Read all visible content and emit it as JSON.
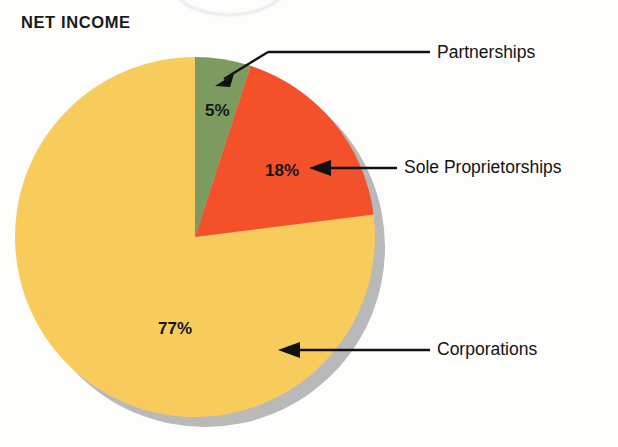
{
  "chart_data": {
    "type": "pie",
    "title": "NET INCOME",
    "categories": [
      "Partnerships",
      "Sole Proprietorships",
      "Corporations"
    ],
    "values": [
      5,
      18,
      77
    ],
    "value_labels": [
      "5%",
      "18%",
      "77%"
    ],
    "unit": "percent",
    "colors": [
      "#7d9b5f",
      "#f4502a",
      "#f8cb5d"
    ],
    "start_angle_deg": 0,
    "direction": "clockwise",
    "legend": "callout-labels",
    "grid": false,
    "shadow_color": "#b9b9b9",
    "slices": [
      {
        "name": "Partnerships",
        "value": 5,
        "value_label": "5%",
        "color": "#7d9b5f",
        "callout": "Partnerships",
        "callout_style": "elbow-arrow"
      },
      {
        "name": "Sole Proprietorships",
        "value": 18,
        "value_label": "18%",
        "color": "#f4502a",
        "callout": "Sole Proprietorships",
        "callout_style": "horizontal-arrow"
      },
      {
        "name": "Corporations",
        "value": 77,
        "value_label": "77%",
        "color": "#f8cb5d",
        "callout": "Corporations",
        "callout_style": "horizontal-arrow"
      }
    ]
  },
  "figure": {
    "title": "NET INCOME",
    "background": "#fdfdfc"
  },
  "labels": {
    "partnerships_pct": "5%",
    "sole_proprietorships_pct": "18%",
    "corporations_pct": "77%",
    "partnerships_name": "Partnerships",
    "sole_proprietorships_name": "Sole Proprietorships",
    "corporations_name": "Corporations"
  }
}
